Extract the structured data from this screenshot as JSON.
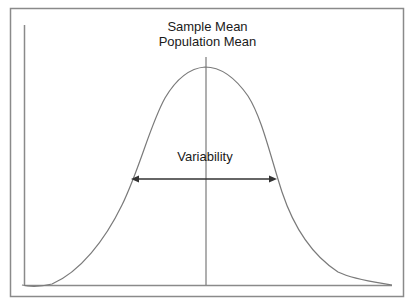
{
  "diagram": {
    "title_line_1": "Sample  Mean",
    "title_line_2": "Population Mean",
    "variability_label": "Variability",
    "colors": {
      "curve": "#7a7a7a",
      "axis": "#8a8a8a",
      "border": "#888888",
      "arrow": "#333333",
      "text": "#1a1a1a",
      "background": "#ffffff"
    },
    "elements": {
      "curve": "normal-distribution-bell-curve",
      "mean_line": "vertical-line-at-mean",
      "variability_arrow": "double-headed-horizontal-arrow"
    }
  }
}
